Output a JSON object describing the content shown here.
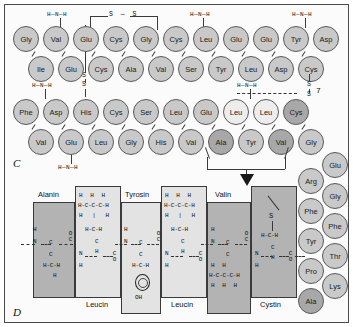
{
  "figure": {
    "panel_c_letter": "C",
    "panel_d_letter": "D",
    "colors": {
      "residue_fill": "#c9c9c9",
      "residue_fill_light": "#ededed",
      "residue_fill_dark": "#a8a8a8",
      "box_dark": "#b3b3b3",
      "box_light": "#e3e3e3",
      "stroke": "#3a3a3a",
      "background": "#fbfbfb"
    }
  },
  "panel_c": {
    "label": "C",
    "rows": [
      {
        "name": "row-1",
        "residues": [
          "Gly",
          "Val",
          "Glu",
          "Cys",
          "Gly",
          "Cys",
          "Leu",
          "Glu",
          "Glu",
          "Tyr",
          "Asp"
        ]
      },
      {
        "name": "row-2",
        "residues": [
          "Ile",
          "Glu",
          "Cys",
          "Ala",
          "Val",
          "Ser",
          "Tyr",
          "Leu",
          "Asp",
          "Cys"
        ]
      },
      {
        "name": "row-3",
        "residues": [
          "Phe",
          "Asp",
          "His",
          "Cys",
          "Ser",
          "Leu",
          "Glu",
          "Leu",
          "Leu",
          "Cys"
        ]
      },
      {
        "name": "row-4",
        "residues": [
          "Val",
          "Glu",
          "Leu",
          "Gly",
          "His",
          "Val",
          "Ala",
          "Tyr",
          "Val",
          "Gly"
        ]
      }
    ],
    "side_chain_right": {
      "name": "right-vertical-chain",
      "column_left": [
        "Arg",
        "Phe",
        "Tyr",
        "Pro",
        "Ala"
      ],
      "column_right": [
        "Glu",
        "Gly",
        "Phe",
        "Thr",
        "Lys"
      ]
    },
    "amine_labels": [
      "H — N — H",
      "H — N — H",
      "H — N — H",
      "H — N — H",
      "H — N — H",
      "H — N — H"
    ],
    "amine_text": "H—N—H",
    "disulfide_labels": [
      "S",
      "S",
      "S",
      "S",
      "S",
      "S",
      "S"
    ],
    "disulfide_top_text": "S — S",
    "sulfur_symbol": "S",
    "annotation_number": "7"
  },
  "panel_d": {
    "label": "D",
    "residues": [
      {
        "name": "alanin",
        "label": "Alanin",
        "shade": "dark",
        "side_chain": [
          "H-C-H",
          "H"
        ]
      },
      {
        "name": "leucin-1",
        "label": "Leucin",
        "shade": "light",
        "side_chain": [
          "H   H   H",
          "H-C-C-C-H",
          "H   |   H",
          "H-C-H"
        ]
      },
      {
        "name": "tyrosin",
        "label": "Tyrosin",
        "shade": "light",
        "side_chain": [
          "H-C-H",
          "ring",
          "OH"
        ]
      },
      {
        "name": "leucin-2",
        "label": "Leucin",
        "shade": "light",
        "side_chain": [
          "H   H   H",
          "H-C-C-C-H",
          "H   |   H",
          "H-C-H"
        ]
      },
      {
        "name": "valin",
        "label": "Valin",
        "shade": "dark",
        "side_chain": [
          "H       H",
          "H-C-C-C-H",
          "H   H   H"
        ]
      },
      {
        "name": "cystin",
        "label": "Cystin",
        "shade": "dark",
        "side_chain": [
          "S",
          "H-C-H"
        ]
      }
    ],
    "backbone_atoms": {
      "nitrogen": "N",
      "hydrogen": "H",
      "carbon": "C",
      "oxygen": "O"
    },
    "hydroxyl_label": "OH",
    "sulfur_label": "S",
    "carbonyl_o": "O",
    "carbonyl_c": "C"
  }
}
